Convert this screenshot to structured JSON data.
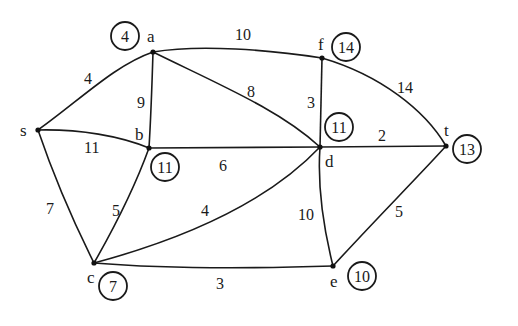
{
  "graph": {
    "nodes": [
      {
        "id": "s",
        "label": "s",
        "distance": null
      },
      {
        "id": "a",
        "label": "a",
        "distance": "4"
      },
      {
        "id": "b",
        "label": "b",
        "distance": "11"
      },
      {
        "id": "c",
        "label": "c",
        "distance": "7"
      },
      {
        "id": "d",
        "label": "d",
        "distance": "11"
      },
      {
        "id": "e",
        "label": "e",
        "distance": "10"
      },
      {
        "id": "f",
        "label": "f",
        "distance": "14"
      },
      {
        "id": "t",
        "label": "t",
        "distance": "13"
      }
    ],
    "edges": [
      {
        "from": "s",
        "to": "a",
        "weight": "4"
      },
      {
        "from": "s",
        "to": "b",
        "weight": "11"
      },
      {
        "from": "s",
        "to": "c",
        "weight": "7"
      },
      {
        "from": "a",
        "to": "b",
        "weight": "9"
      },
      {
        "from": "a",
        "to": "f",
        "weight": "10"
      },
      {
        "from": "a",
        "to": "d",
        "weight": "8"
      },
      {
        "from": "b",
        "to": "d",
        "weight": "6"
      },
      {
        "from": "b",
        "to": "c",
        "weight": "5"
      },
      {
        "from": "c",
        "to": "d",
        "weight": "4"
      },
      {
        "from": "c",
        "to": "e",
        "weight": "3"
      },
      {
        "from": "f",
        "to": "d",
        "weight": "3"
      },
      {
        "from": "f",
        "to": "t",
        "weight": "14"
      },
      {
        "from": "d",
        "to": "t",
        "weight": "2"
      },
      {
        "from": "d",
        "to": "e",
        "weight": "10"
      },
      {
        "from": "e",
        "to": "t",
        "weight": "5"
      }
    ]
  }
}
